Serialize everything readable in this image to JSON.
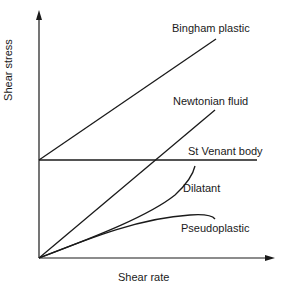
{
  "diagram": {
    "axes": {
      "x_label": "Shear rate",
      "y_label": "Shear stress"
    },
    "curves": [
      {
        "id": "bingham",
        "label": "Bingham plastic",
        "shape": "straight line with yield-stress intercept"
      },
      {
        "id": "newtonian",
        "label": "Newtonian fluid",
        "shape": "straight line through origin"
      },
      {
        "id": "st-venant",
        "label": "St Venant body",
        "shape": "horizontal line at yield stress"
      },
      {
        "id": "dilatant",
        "label": "Dilatant",
        "shape": "concave-up curve through origin"
      },
      {
        "id": "pseudoplastic",
        "label": "Pseudoplastic",
        "shape": "concave-down curve through origin"
      }
    ],
    "colors": {
      "line": "#1a1a1a",
      "background": "#ffffff"
    }
  }
}
